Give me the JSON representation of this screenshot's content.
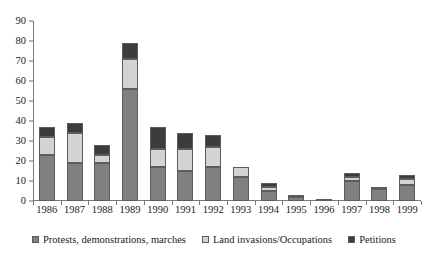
{
  "chart_data": {
    "type": "bar",
    "stacked": true,
    "title": "",
    "xlabel": "",
    "ylabel": "",
    "ylim": [
      0,
      90
    ],
    "yticks": [
      0,
      10,
      20,
      30,
      40,
      50,
      60,
      70,
      80,
      90
    ],
    "grid": false,
    "legend_position": "bottom",
    "categories": [
      "1986",
      "1987",
      "1988",
      "1989",
      "1990",
      "1991",
      "1992",
      "1993",
      "1994",
      "1995",
      "1996",
      "1997",
      "1998",
      "1999"
    ],
    "series": [
      {
        "name": "Protests, demonstrations, marches",
        "color": "#808080",
        "values": [
          23,
          19,
          19,
          56,
          17,
          15,
          17,
          12,
          5,
          2,
          1,
          10,
          6,
          8
        ]
      },
      {
        "name": "Land invasions/Occupations",
        "color": "#d3d3d3",
        "values": [
          9,
          15,
          4,
          15,
          9,
          11,
          10,
          5,
          2,
          1,
          0,
          2,
          1,
          3
        ]
      },
      {
        "name": "Petitions",
        "color": "#3c3c3c",
        "values": [
          5,
          5,
          5,
          8,
          11,
          8,
          6,
          0,
          2,
          0,
          0,
          2,
          0,
          2
        ]
      }
    ],
    "totals": [
      37,
      39,
      28,
      79,
      37,
      34,
      33,
      17,
      9,
      3,
      1,
      14,
      7,
      13
    ]
  },
  "legend": {
    "items": [
      {
        "label": "Protests, demonstrations, marches",
        "swatch": "protests-swatch"
      },
      {
        "label": "Land invasions/Occupations",
        "swatch": "land-swatch"
      },
      {
        "label": "Petitions",
        "swatch": "petitions-swatch"
      }
    ]
  }
}
